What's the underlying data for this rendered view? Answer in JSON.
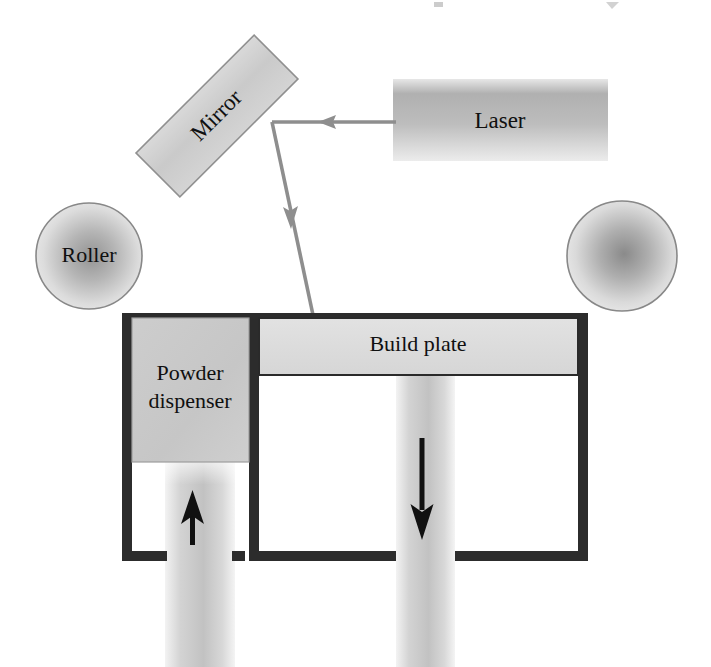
{
  "figure": {
    "kind": "schematic-diagram",
    "background_color": "#ffffff"
  },
  "labels": {
    "laser": "Laser",
    "mirror": "Mirror",
    "roller_left": "Roller",
    "roller_right": "",
    "build_plate": "Build plate",
    "powder_dispenser_line1": "Powder",
    "powder_dispenser_line2": "dispenser"
  },
  "components": {
    "laser": {
      "name": "Laser",
      "shape": "rectangle",
      "x": 393,
      "y": 79,
      "width": 215,
      "height": 82,
      "fill_light": "#d8d8d8",
      "fill_dark": "#a8a8a8",
      "label_x": 500,
      "label_y": 122
    },
    "mirror": {
      "name": "Mirror",
      "shape": "rotated-rectangle",
      "center_x": 217,
      "center_y": 116,
      "width": 167,
      "height": 62,
      "rotation_deg": -45,
      "fill": "#cfcfcf",
      "stroke": "#8d8d8d",
      "text_rotation_deg": -45
    },
    "roller_left": {
      "name": "Roller",
      "shape": "circle",
      "cx": 89,
      "cy": 256,
      "r": 53,
      "fill_center": "#9a9a9a",
      "fill_edge": "#e4e4e4",
      "stroke": "#8a8a8a",
      "has_label": true
    },
    "roller_right": {
      "name": "Roller",
      "shape": "circle",
      "cx": 622,
      "cy": 256,
      "r": 55,
      "fill_center": "#8f8f8f",
      "fill_edge": "#e4e4e4",
      "stroke": "#8a8a8a",
      "has_label": false
    },
    "build_plate": {
      "name": "Build plate",
      "shape": "rectangle",
      "x": 259,
      "y": 315,
      "width": 319,
      "height": 60,
      "fill": "#dcdcdc",
      "stroke": "#2a2a2a",
      "label_x": 418,
      "label_y": 345
    },
    "powder_dispenser": {
      "name": "Powder dispenser",
      "shape": "rectangle",
      "x": 132,
      "y": 313,
      "width": 117,
      "height": 149,
      "fill": "#c9c9c9",
      "stroke": "#9a9a9a",
      "label_x": 190,
      "label_y": 378
    },
    "chamber_walls": {
      "color": "#2c2c2c",
      "thickness": 10,
      "left_wall_x": 122,
      "divider_x": 249,
      "right_wall_x": 578,
      "top_y": 313,
      "bottom_y": 551
    },
    "piston_left": {
      "name": "Powder dispenser piston shaft",
      "x": 165,
      "y": 462,
      "width": 70,
      "height": 205,
      "fill_light": "#efefef",
      "fill_mid": "#c6c6c6",
      "direction": "up",
      "arrow_x": 193,
      "arrow_top_y": 495,
      "arrow_bottom_y": 545
    },
    "piston_right": {
      "name": "Build platform piston shaft",
      "x": 396,
      "y": 375,
      "width": 59,
      "height": 292,
      "fill_light": "#efefef",
      "fill_mid": "#c6c6c6",
      "direction": "down",
      "arrow_x": 422,
      "arrow_top_y": 438,
      "arrow_bottom_y": 537
    },
    "beam": {
      "name": "Laser beam path",
      "color": "#8e8e8e",
      "stroke_width": 4,
      "segments": [
        {
          "from_x": 393,
          "from_y": 122,
          "to_x": 272,
          "to_y": 122,
          "arrow_at_x": 330,
          "arrow_at_y": 122,
          "direction": "left"
        },
        {
          "from_x": 272,
          "from_y": 122,
          "to_x": 313,
          "to_y": 314,
          "arrow_at_x": 291,
          "arrow_at_y": 220,
          "direction": "down-right"
        }
      ]
    }
  },
  "ghost_artifacts": {
    "description": "faint cut-off glyph fragments from the page above",
    "marks": [
      {
        "x": 438,
        "y": 6,
        "glyph": "▬"
      },
      {
        "x": 612,
        "y": 5,
        "glyph": "◤"
      }
    ]
  }
}
